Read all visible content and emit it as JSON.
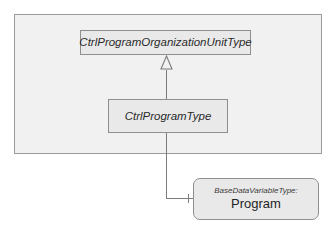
{
  "figure": {
    "caption_fragment": "‐‐‐ ‐‐  ‐‐ ‐ ‐ ‐‐   ‐ ‐   ‐‐‐",
    "background_color": "#ffffff"
  },
  "container": {
    "name": "outer-frame",
    "fill_color": "#f1f1f1",
    "border_color": "#9a9a9a"
  },
  "nodes": {
    "org_unit_type": {
      "label": "CtrlProgramOrganizationUnitType",
      "style": "abstract-class",
      "fill_color": "#e9e9e9",
      "border_color": "#8f8f8f"
    },
    "program_type": {
      "label": "CtrlProgramType",
      "style": "abstract-class",
      "fill_color": "#e9e9e9",
      "border_color": "#8f8f8f"
    },
    "program_instance": {
      "type_ref": "BaseDataVariableType:",
      "label": "Program",
      "style": "instance",
      "fill_color": "#e9e9e9",
      "border_color": "#8f8f8f"
    }
  },
  "edges": {
    "generalization": {
      "label": "generalization",
      "from": "CtrlProgramType",
      "to": "CtrlProgramOrganizationUnitType",
      "arrow": "hollow-triangle",
      "line_color": "#7c7c7c"
    },
    "composition": {
      "label": "has-component",
      "from": "CtrlProgramType",
      "to": "Program",
      "arrow": "none",
      "line_color": "#7c7c7c"
    }
  }
}
